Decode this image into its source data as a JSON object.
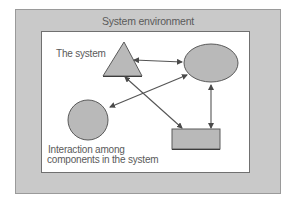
{
  "diagram": {
    "environment": {
      "title": "System environment",
      "fill_color": "#c9c9c9"
    },
    "system": {
      "label": "The system",
      "fill_color": "#ffffff"
    },
    "interaction_caption": {
      "line1": "Interaction among",
      "line2": "components in the system"
    },
    "components": [
      {
        "id": "triangle",
        "shape": "triangle",
        "fill": "#b9b9b9"
      },
      {
        "id": "ellipse",
        "shape": "ellipse",
        "fill": "#b9b9b9"
      },
      {
        "id": "circle",
        "shape": "circle",
        "fill": "#b9b9b9"
      },
      {
        "id": "rectangle",
        "shape": "rectangle",
        "fill": "#b9b9b9"
      }
    ],
    "connections": [
      {
        "from": "triangle",
        "to": "ellipse",
        "type": "bidirectional-arrow"
      },
      {
        "from": "circle",
        "to": "ellipse",
        "type": "bidirectional-arrow"
      },
      {
        "from": "triangle",
        "to": "rectangle",
        "type": "bidirectional-arrow"
      },
      {
        "from": "ellipse",
        "to": "rectangle",
        "type": "bidirectional-arrow"
      }
    ],
    "colors": {
      "shape_stroke": "#5a5a5a",
      "arrow": "#555555",
      "text": "#5a5a5a"
    }
  }
}
